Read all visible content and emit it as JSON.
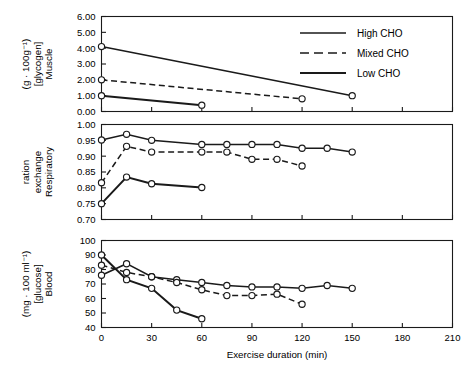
{
  "figure": {
    "xlabel": "Exercise duration (min)",
    "xticks": [
      0,
      30,
      60,
      90,
      120,
      150,
      180,
      210
    ],
    "xlim": [
      0,
      210
    ]
  },
  "legend": {
    "position": "top-right",
    "items": [
      {
        "label": "High CHO",
        "style": "solid",
        "width": 1.5
      },
      {
        "label": "Mixed CHO",
        "style": "dashed",
        "width": 1.5
      },
      {
        "label": "Low CHO",
        "style": "solid",
        "width": 2.0
      }
    ]
  },
  "colors": {
    "line": "#1a1a1a",
    "marker_fill": "#ffffff",
    "axis": "#1a1a1a",
    "background": "#ffffff"
  },
  "chart_data": [
    {
      "type": "line",
      "panel": "top",
      "title": "",
      "xlabel": "",
      "ylabel": "Muscle [glycogen] (g · 100g⁻¹)",
      "ylabel_lines": [
        "Muscle",
        "[glycogen]",
        "(g · 100g⁻¹)"
      ],
      "xlim": [
        0,
        210
      ],
      "ylim": [
        0.0,
        6.0
      ],
      "yticks": [
        0.0,
        1.0,
        2.0,
        3.0,
        4.0,
        5.0,
        6.0
      ],
      "ytick_labels": [
        "0.00",
        "1.00",
        "2.00",
        "3.00",
        "4.00",
        "5.00",
        "6.00"
      ],
      "grid": false,
      "series": [
        {
          "name": "High CHO",
          "style": "solid",
          "width": 1.5,
          "x": [
            0,
            150
          ],
          "values": [
            4.1,
            1.0
          ]
        },
        {
          "name": "Mixed CHO",
          "style": "dashed",
          "width": 1.5,
          "x": [
            0,
            120
          ],
          "values": [
            2.0,
            0.8
          ]
        },
        {
          "name": "Low CHO",
          "style": "solid",
          "width": 2.0,
          "x": [
            0,
            60
          ],
          "values": [
            1.0,
            0.4
          ]
        }
      ]
    },
    {
      "type": "line",
      "panel": "middle",
      "title": "",
      "xlabel": "",
      "ylabel": "Respiratory exchange ration",
      "ylabel_lines": [
        "Respiratory",
        "exchange",
        "ration"
      ],
      "xlim": [
        0,
        210
      ],
      "ylim": [
        0.7,
        1.0
      ],
      "yticks": [
        0.7,
        0.75,
        0.8,
        0.85,
        0.9,
        0.95,
        1.0
      ],
      "ytick_labels": [
        "0.70",
        "0.75",
        "0.80",
        "0.85",
        "0.90",
        "0.95",
        "1.00"
      ],
      "grid": false,
      "series": [
        {
          "name": "High CHO",
          "style": "solid",
          "width": 1.5,
          "x": [
            0,
            15,
            30,
            60,
            75,
            90,
            105,
            120,
            135,
            150
          ],
          "values": [
            0.951,
            0.969,
            0.95,
            0.937,
            0.937,
            0.937,
            0.937,
            0.925,
            0.925,
            0.913
          ]
        },
        {
          "name": "Mixed CHO",
          "style": "dashed",
          "width": 1.5,
          "x": [
            0,
            15,
            30,
            60,
            75,
            90,
            105,
            120
          ],
          "values": [
            0.816,
            0.931,
            0.913,
            0.913,
            0.913,
            0.89,
            0.89,
            0.869
          ]
        },
        {
          "name": "Low CHO",
          "style": "solid",
          "width": 2.0,
          "x": [
            0,
            15,
            30,
            60
          ],
          "values": [
            0.75,
            0.834,
            0.813,
            0.801
          ]
        }
      ]
    },
    {
      "type": "line",
      "panel": "bottom",
      "title": "",
      "xlabel": "Exercise duration (min)",
      "ylabel": "Blood [glucose] (mg · 100 ml⁻¹)",
      "ylabel_lines": [
        "Blood",
        "[glucose]",
        "(mg · 100 ml⁻¹)"
      ],
      "xlim": [
        0,
        210
      ],
      "ylim": [
        40,
        100
      ],
      "yticks": [
        40,
        50,
        60,
        70,
        80,
        90,
        100
      ],
      "ytick_labels": [
        "40",
        "50",
        "60",
        "70",
        "80",
        "90",
        "100"
      ],
      "grid": false,
      "series": [
        {
          "name": "High CHO",
          "style": "solid",
          "width": 1.5,
          "x": [
            0,
            15,
            30,
            45,
            60,
            75,
            90,
            105,
            120,
            135,
            150
          ],
          "values": [
            76.0,
            84.0,
            75.0,
            73.0,
            71.0,
            69.0,
            68.0,
            68.0,
            67.0,
            69.0,
            67.0
          ]
        },
        {
          "name": "Mixed CHO",
          "style": "dashed",
          "width": 1.5,
          "x": [
            0,
            15,
            30,
            45,
            60,
            75,
            90,
            105,
            120
          ],
          "values": [
            83.0,
            78.0,
            75.0,
            71.0,
            66.0,
            62.0,
            62.0,
            63.0,
            56.0
          ]
        },
        {
          "name": "Low CHO",
          "style": "solid",
          "width": 2.0,
          "x": [
            0,
            15,
            30,
            45,
            60
          ],
          "values": [
            90.0,
            73.0,
            67.0,
            52.0,
            46.0
          ]
        }
      ]
    }
  ]
}
